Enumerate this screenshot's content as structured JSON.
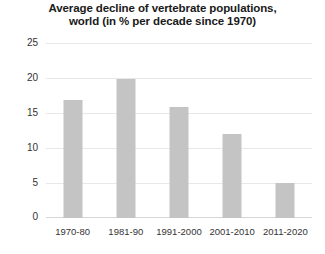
{
  "chart_data": {
    "type": "bar",
    "title": "Average decline of vertebrate populations, world (in % per decade since 1970)",
    "title_lines": [
      "Average decline of vertebrate populations,",
      "world (in % per decade since 1970)"
    ],
    "categories": [
      "1970-80",
      "1981-90",
      "1991-2000",
      "2001-2010",
      "2011-2020"
    ],
    "values": [
      17,
      20,
      16,
      12,
      5
    ],
    "xlabel": "",
    "ylabel": "",
    "ylim": [
      0,
      25
    ],
    "yticks": [
      25,
      20,
      15,
      10,
      5,
      0
    ],
    "ytick_labels": [
      "25",
      "20",
      "15",
      "10",
      "5",
      "0"
    ],
    "grid": true,
    "legend": false,
    "bar_color": "#c4c4c4",
    "grid_color": "#e8e8e8",
    "text_color": "#333333",
    "background": "#ffffff"
  }
}
